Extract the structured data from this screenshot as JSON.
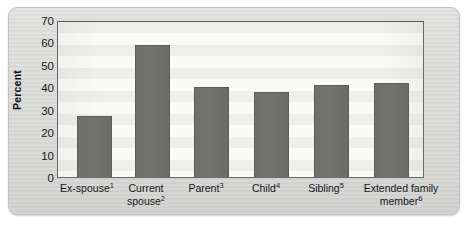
{
  "figure": {
    "kind": "bar-chart",
    "background_color": "#dcdcda",
    "plot_background_color": "#f6f6f4",
    "bar_color": "#707070",
    "axis_color": "#6a6a68"
  },
  "chart_data": {
    "type": "bar",
    "title": "",
    "xlabel": "",
    "ylabel": "Percent",
    "ylim": [
      0,
      70
    ],
    "yticks": [
      0,
      10,
      20,
      30,
      40,
      50,
      60,
      70
    ],
    "ytick_labels": [
      "0",
      "10",
      "20",
      "30",
      "40",
      "50",
      "60",
      "70"
    ],
    "grid": false,
    "legend": null,
    "categories": [
      "Ex-spouse",
      "Current spouse",
      "Parent",
      "Child",
      "Sibling",
      "Extended family member"
    ],
    "category_footnotes": [
      "1",
      "2",
      "3",
      "4",
      "5",
      "6"
    ],
    "category_label_lines": [
      [
        "Ex-spouse"
      ],
      [
        "Current",
        "spouse"
      ],
      [
        "Parent"
      ],
      [
        "Child"
      ],
      [
        "Sibling"
      ],
      [
        "Extended family",
        "member"
      ]
    ],
    "values": [
      27,
      59,
      40,
      38,
      41,
      42
    ],
    "series": [
      {
        "name": "Percent",
        "values": [
          27,
          59,
          40,
          38,
          41,
          42
        ]
      }
    ]
  }
}
